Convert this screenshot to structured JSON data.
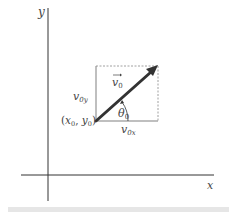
{
  "diagram": {
    "axes": {
      "x_label": "x",
      "y_label": "y"
    },
    "vector": {
      "label": "v",
      "label_sub": "0",
      "has_arrow_over": true
    },
    "components": {
      "vertical": {
        "base": "v",
        "sub": "0y"
      },
      "horizontal": {
        "base": "v",
        "sub": "0x"
      }
    },
    "angle": {
      "base": "θ",
      "sub": "0"
    },
    "origin_point": {
      "open": "(",
      "x_base": "x",
      "x_sub": "0",
      "sep": ", ",
      "y_base": "y",
      "y_sub": "0",
      "close": ")"
    },
    "colors": {
      "axis": "#333333",
      "vector": "#333333",
      "component_lines": "#aaaaaa",
      "label": "#444444"
    }
  }
}
